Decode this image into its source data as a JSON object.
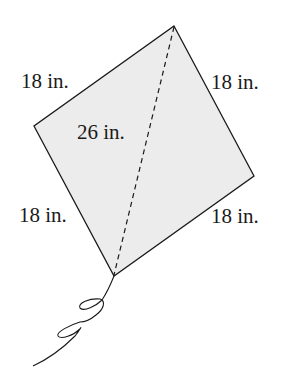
{
  "diagram": {
    "colors": {
      "fill": "#ececec",
      "stroke": "#1a1a1a",
      "background": "#ffffff"
    },
    "vertices": {
      "top": [
        174,
        26
      ],
      "left": [
        34,
        126
      ],
      "right": [
        254,
        176
      ],
      "bottom": [
        114,
        276
      ]
    },
    "labels": {
      "side_top_left": "18 in.",
      "side_top_right": "18 in.",
      "side_bottom_left": "18 in.",
      "side_bottom_right": "18 in.",
      "diagonal": "26 in."
    },
    "diagonal_style": "dashed",
    "tail": "string with two loops"
  }
}
